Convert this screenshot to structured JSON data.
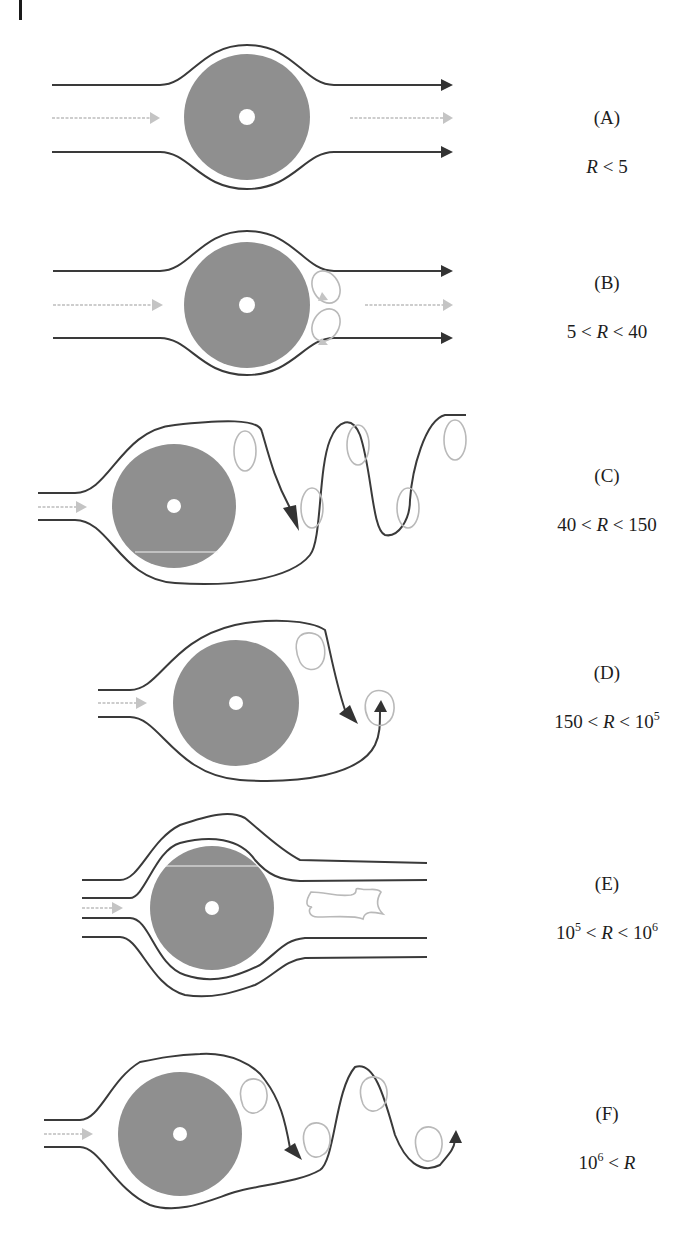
{
  "figure": {
    "colors": {
      "cylinder": "#8f8f8f",
      "streamline": "#3a3a3a",
      "inflow_arrow": "#bdbdbd",
      "eddy": "#b9b9b9",
      "background": "#ffffff"
    },
    "panels": [
      {
        "id": "A",
        "letter": "(A)",
        "cond_parts": [
          "",
          "R",
          " < 5"
        ],
        "description": "Laminar flow, streamlines close smoothly behind cylinder"
      },
      {
        "id": "B",
        "letter": "(B)",
        "cond_parts": [
          "5 < ",
          "R",
          " < 40"
        ],
        "description": "Pair of fixed standing eddies behind cylinder"
      },
      {
        "id": "C",
        "letter": "(C)",
        "cond_parts": [
          "40 < ",
          "R",
          " < 150"
        ],
        "description": "Laminar vortex street"
      },
      {
        "id": "D",
        "letter": "(D)",
        "cond_parts": [
          "150 < ",
          "R",
          " < 10",
          "5",
          ""
        ],
        "description": "Turbulent vortex street, laminar boundary layer"
      },
      {
        "id": "E",
        "letter": "(E)",
        "cond_parts": [
          "10",
          "5",
          " < ",
          "R",
          " < 10",
          "6"
        ],
        "description": "Turbulent boundary layer, narrow turbulent wake"
      },
      {
        "id": "F",
        "letter": "(F)",
        "cond_parts": [
          "10",
          "6",
          " < ",
          "R"
        ],
        "description": "Re-established turbulent vortex street"
      }
    ]
  }
}
